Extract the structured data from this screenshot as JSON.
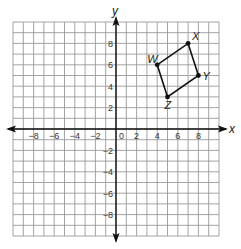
{
  "graph": {
    "x_axis_label": "x",
    "y_axis_label": "y",
    "x_range": [
      -10,
      10
    ],
    "y_range": [
      -10,
      10
    ],
    "origin_label": "0",
    "x_ticks": [
      {
        "value": -8,
        "label": "−8"
      },
      {
        "value": -6,
        "label": "−6"
      },
      {
        "value": -4,
        "label": "−4"
      },
      {
        "value": -2,
        "label": "−2"
      },
      {
        "value": 2,
        "label": "2"
      },
      {
        "value": 4,
        "label": "4"
      },
      {
        "value": 6,
        "label": "6"
      },
      {
        "value": 8,
        "label": "8"
      }
    ],
    "y_ticks": [
      {
        "value": 8,
        "label": "8"
      },
      {
        "value": 6,
        "label": "6"
      },
      {
        "value": 4,
        "label": "4"
      },
      {
        "value": 2,
        "label": "2"
      },
      {
        "value": -2,
        "label": "−2"
      },
      {
        "value": -4,
        "label": "−4"
      },
      {
        "value": -6,
        "label": "−6"
      },
      {
        "value": -8,
        "label": "−8"
      }
    ],
    "grid_color": "#9a9a9a",
    "axis_color": "#111111",
    "shape_color": "#111111"
  },
  "quadrilateral": {
    "name": "WXYZ",
    "vertices": [
      {
        "label": "W",
        "x": 4,
        "y": 6
      },
      {
        "label": "X",
        "x": 7,
        "y": 8
      },
      {
        "label": "Y",
        "x": 8,
        "y": 5
      },
      {
        "label": "Z",
        "x": 5,
        "y": 3
      }
    ]
  }
}
